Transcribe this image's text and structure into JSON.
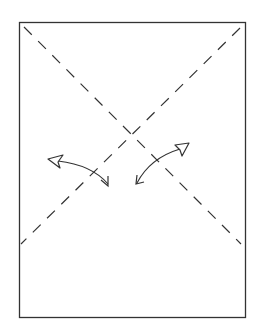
{
  "diagram": {
    "title": "",
    "colors": {
      "stroke": "#333333",
      "background": "#ffffff"
    },
    "elements": [
      {
        "type": "paper-rectangle"
      },
      {
        "type": "fold-line",
        "style": "dashed",
        "direction": "top-left to lower-right"
      },
      {
        "type": "fold-line",
        "style": "dashed",
        "direction": "top-right to lower-left"
      },
      {
        "type": "fold-arrow",
        "heads": [
          "hollow-left",
          "open-down"
        ],
        "side": "left"
      },
      {
        "type": "fold-arrow",
        "heads": [
          "hollow-up-right",
          "open-down-left"
        ],
        "side": "right"
      }
    ]
  }
}
